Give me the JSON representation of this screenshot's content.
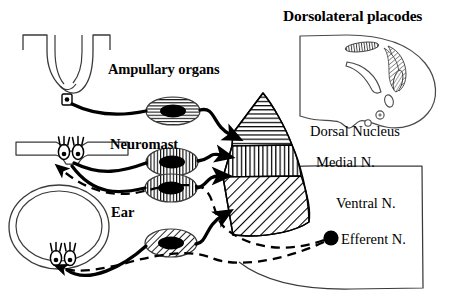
{
  "figure": {
    "title": "Dorsolateral placodes",
    "labels": {
      "dorsolateral_placodes": "Dorsolateral placodes",
      "ampullary_organs": "Ampullary organs",
      "neuromast": "Neuromast",
      "ear": "Ear",
      "dorsal_nucleus": "Dorsal Nucleus",
      "medial_nucleus": "Medial N.",
      "ventral_nucleus": "Ventral N.",
      "efferent_nucleus": "Efferent N."
    },
    "colors": {
      "ink": "#000000",
      "background": "#ffffff",
      "outline_thin": "#3a3a3a"
    },
    "peripheral_organs": [
      {
        "name": "ampullary-organ",
        "label": "Ampullary organs",
        "shape": "u-shaped-canal",
        "receptor_count": 1,
        "projects_to": "Dorsal Nucleus",
        "ganglion_pattern": "horizontal-lines"
      },
      {
        "name": "neuromast",
        "label": "Neuromast",
        "shape": "lateral-line-canal",
        "receptor_count": 2,
        "projects_to": "Medial N.",
        "ganglion_pattern": "vertical-lines"
      },
      {
        "name": "ear",
        "label": "Ear",
        "shape": "semicircular-canal",
        "receptor_count": 2,
        "projects_to": "Ventral N.",
        "ganglion_pattern": "diagonal-hatch"
      }
    ],
    "hindbrain_nuclei": [
      {
        "name": "dorsal-nucleus",
        "label": "Dorsal Nucleus",
        "pattern": "horizontal-lines"
      },
      {
        "name": "medial-nucleus",
        "label": "Medial N.",
        "pattern": "vertical-lines"
      },
      {
        "name": "ventral-nucleus",
        "label": "Ventral N.",
        "pattern": "diagonal-hatch"
      },
      {
        "name": "efferent-nucleus",
        "label": "Efferent N.",
        "pattern": "solid-black-dot"
      }
    ],
    "ganglia": [
      {
        "name": "ganglion-ampullary",
        "pattern": "horizontal-lines"
      },
      {
        "name": "ganglion-neuromast-upper",
        "pattern": "vertical-lines"
      },
      {
        "name": "ganglion-neuromast-lower",
        "pattern": "vertical-lines"
      },
      {
        "name": "ganglion-ear",
        "pattern": "diagonal-hatch"
      }
    ],
    "pathways": {
      "afferent": {
        "style": "solid",
        "arrowheads": true,
        "count": 4
      },
      "efferent": {
        "style": "dashed",
        "arrowheads": true,
        "count": 2
      }
    },
    "placodes_in_head": [
      {
        "name": "placode-small-upper",
        "pattern": "vertical-lines"
      },
      {
        "name": "placode-large-crescent",
        "pattern": "diagonal-lines"
      },
      {
        "name": "placode-blank-crescent",
        "pattern": "none"
      },
      {
        "name": "placode-small-lower",
        "pattern": "cross-hatch"
      },
      {
        "name": "otic-vesicle",
        "pattern": "none"
      },
      {
        "name": "eye",
        "pattern": "none"
      }
    ]
  }
}
